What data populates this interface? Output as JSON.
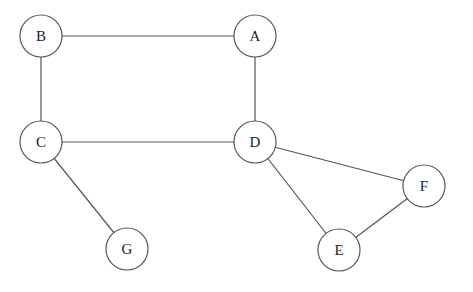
{
  "graph": {
    "nodes": [
      {
        "id": "A",
        "label": "A",
        "x": 255,
        "y": 36
      },
      {
        "id": "B",
        "label": "B",
        "x": 41,
        "y": 36
      },
      {
        "id": "C",
        "label": "C",
        "x": 41,
        "y": 142
      },
      {
        "id": "D",
        "label": "D",
        "x": 255,
        "y": 142
      },
      {
        "id": "E",
        "label": "E",
        "x": 339,
        "y": 250
      },
      {
        "id": "F",
        "label": "F",
        "x": 424,
        "y": 186
      },
      {
        "id": "G",
        "label": "G",
        "x": 127,
        "y": 249
      }
    ],
    "edges": [
      {
        "from": "B",
        "to": "A"
      },
      {
        "from": "B",
        "to": "C"
      },
      {
        "from": "A",
        "to": "D"
      },
      {
        "from": "C",
        "to": "D"
      },
      {
        "from": "C",
        "to": "G"
      },
      {
        "from": "D",
        "to": "F"
      },
      {
        "from": "D",
        "to": "E"
      },
      {
        "from": "E",
        "to": "F"
      }
    ],
    "node_radius": 21
  }
}
